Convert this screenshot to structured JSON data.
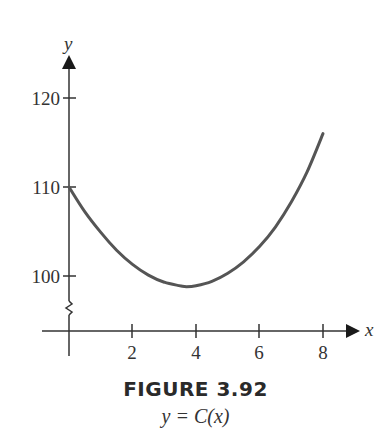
{
  "figure": {
    "title": "FIGURE 3.92",
    "subtitle": "y = C(x)"
  },
  "axes": {
    "x_label": "x",
    "y_label": "y",
    "x_ticks": [
      "2",
      "4",
      "6",
      "8"
    ],
    "y_ticks": [
      "100",
      "110",
      "120"
    ],
    "y_axis_break": true
  },
  "colors": {
    "axis": "#333333",
    "curve": "#555555"
  },
  "chart_data": {
    "type": "line",
    "title": "FIGURE 3.92",
    "subtitle": "y = C(x)",
    "xlabel": "x",
    "ylabel": "y",
    "xlim": [
      0,
      8.5
    ],
    "ylim": [
      97,
      122
    ],
    "x_ticks": [
      2,
      4,
      6,
      8
    ],
    "y_ticks": [
      100,
      110,
      120
    ],
    "grid": false,
    "legend": null,
    "y_axis_break": true,
    "series": [
      {
        "name": "C(x)",
        "x": [
          0,
          0.5,
          1,
          1.5,
          2,
          2.5,
          3,
          3.5,
          3.7,
          4,
          4.5,
          5,
          5.5,
          6,
          6.5,
          7,
          7.5,
          8
        ],
        "values": [
          110,
          107.2,
          104.9,
          102.9,
          101.3,
          100.1,
          99.3,
          98.9,
          98.8,
          98.9,
          99.4,
          100.3,
          101.6,
          103.3,
          105.5,
          108.3,
          111.7,
          116
        ]
      }
    ]
  }
}
